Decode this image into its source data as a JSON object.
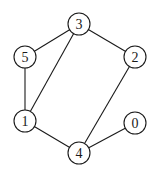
{
  "diagram": {
    "type": "undirected-graph",
    "node_radius": 11,
    "nodes": [
      {
        "id": "0",
        "label": "0",
        "x": 135,
        "y": 123
      },
      {
        "id": "1",
        "label": "1",
        "x": 25,
        "y": 121
      },
      {
        "id": "2",
        "label": "2",
        "x": 135,
        "y": 57
      },
      {
        "id": "3",
        "label": "3",
        "x": 79,
        "y": 24
      },
      {
        "id": "4",
        "label": "4",
        "x": 79,
        "y": 153
      },
      {
        "id": "5",
        "label": "5",
        "x": 25,
        "y": 57
      }
    ],
    "edges": [
      {
        "from": "3",
        "to": "5"
      },
      {
        "from": "3",
        "to": "2"
      },
      {
        "from": "3",
        "to": "1"
      },
      {
        "from": "5",
        "to": "1"
      },
      {
        "from": "1",
        "to": "4"
      },
      {
        "from": "2",
        "to": "4"
      },
      {
        "from": "4",
        "to": "0"
      }
    ]
  }
}
